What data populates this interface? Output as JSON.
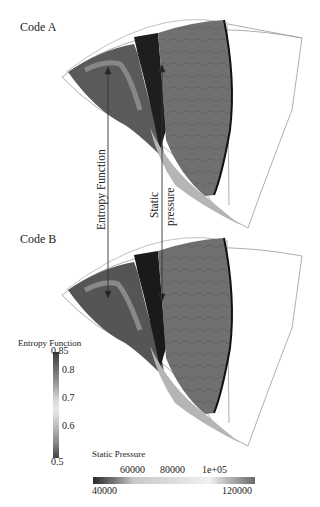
{
  "panels": [
    {
      "label": "Code A"
    },
    {
      "label": "Code B"
    }
  ],
  "annotations": {
    "entropy_arrow": "Entropy Function",
    "pressure_arrow_line1": "Static",
    "pressure_arrow_line2": "pressure"
  },
  "colorbars": {
    "entropy": {
      "title": "Entropy Function",
      "ticks": [
        "0.85",
        "0.8",
        "0.7",
        "0.6",
        "0.5"
      ],
      "min": 0.5,
      "max": 0.85
    },
    "static_pressure": {
      "title": "Static Pressure",
      "ticks_top": [
        "60000",
        "80000",
        "1e+05"
      ],
      "ticks_bottom": [
        "40000",
        "120000"
      ],
      "min": 40000,
      "max": 120000
    }
  },
  "colors": {
    "outline": "#9a9a9a",
    "blade_dark": "#1e1e1e",
    "field_mid": "#6e6e6e",
    "background": "#ffffff"
  }
}
